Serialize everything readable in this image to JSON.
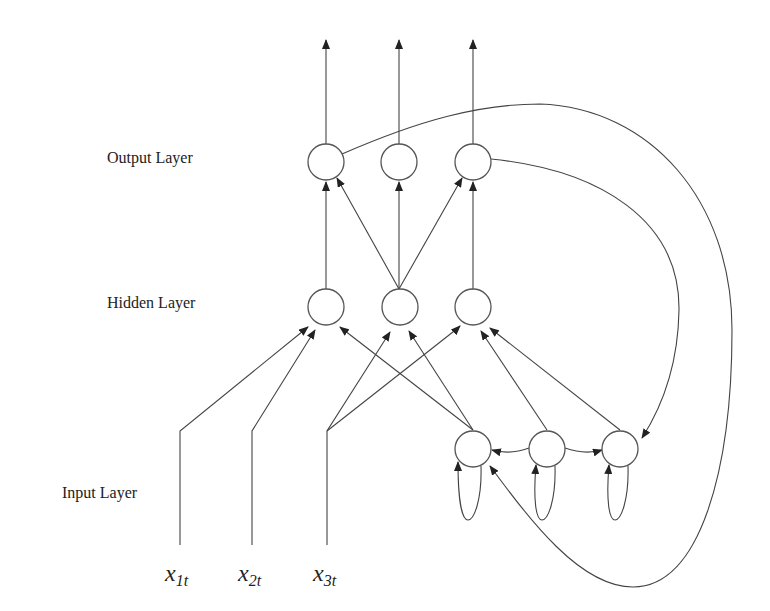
{
  "diagram": {
    "type": "recurrent neural network (Jordan/Elman style)",
    "layers": [
      {
        "id": "output",
        "label": "Output Layer",
        "nodes": 3
      },
      {
        "id": "hidden",
        "label": "Hidden Layer",
        "nodes": 3
      },
      {
        "id": "input",
        "label": "Input Layer",
        "nodes": 3,
        "context_nodes": 3
      }
    ],
    "inputs": [
      {
        "base": "x",
        "sub": "1t"
      },
      {
        "base": "x",
        "sub": "2t"
      },
      {
        "base": "x",
        "sub": "3t"
      }
    ],
    "colors": {
      "stroke": "#444444",
      "background": "#ffffff",
      "text": "#222222"
    }
  },
  "labels": {
    "output_layer": "Output Layer",
    "hidden_layer": "Hidden Layer",
    "input_layer": "Input Layer"
  },
  "inputs": {
    "x1": {
      "base": "x",
      "sub": "1t"
    },
    "x2": {
      "base": "x",
      "sub": "2t"
    },
    "x3": {
      "base": "x",
      "sub": "3t"
    }
  }
}
